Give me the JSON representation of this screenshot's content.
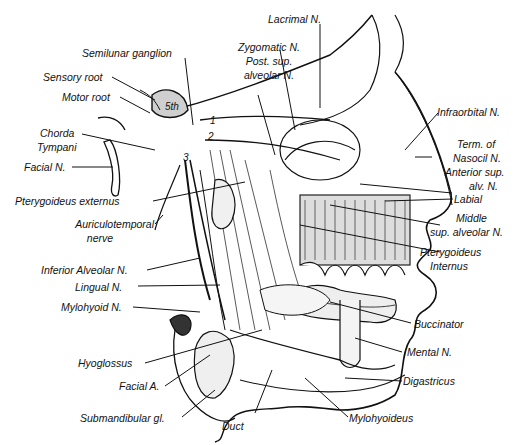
{
  "diagram": {
    "ganglion_label": "5th",
    "division_numbers": [
      "1",
      "2",
      "3"
    ],
    "labels": {
      "lacrimal": "Lacrimal N.",
      "semilunar": "Semilunar ganglion",
      "zygomatic": "Zygomatic N.",
      "post_sup_1": "Post. sup.",
      "post_sup_2": "alveolar N.",
      "sensory_root": "Sensory root",
      "motor_root": "Motor root",
      "chorda_1": "Chorda",
      "chorda_2": "Tympani",
      "facial_n": "Facial N.",
      "infraorbital": "Infraorbital N.",
      "term_1": "Term. of",
      "term_2": "Nasocil N.",
      "ant_sup_1": "Anterior sup.",
      "ant_sup_2": "alv. N.",
      "labial": "Labial",
      "pteryg_ext": "Pterygoideus externus",
      "auriculo_1": "Auriculotemporal",
      "auriculo_2": "nerve",
      "middle_1": "Middle",
      "middle_2": "sup. alveolar N.",
      "pteryg_int_1": "Pterygoideus",
      "pteryg_int_2": "Internus",
      "inf_alveolar": "Inferior Alveolar N.",
      "lingual": "Lingual N.",
      "mylohyoid_n": "Mylohyoid N.",
      "buccinator": "Buccinator",
      "hyoglossus": "Hyoglossus",
      "mental": "Mental N.",
      "facial_a": "Facial A.",
      "digastricus": "Digastricus",
      "submandibular": "Submandibular gl.",
      "duct": "Duct",
      "mylohyoideus": "Mylohyoideus"
    }
  }
}
